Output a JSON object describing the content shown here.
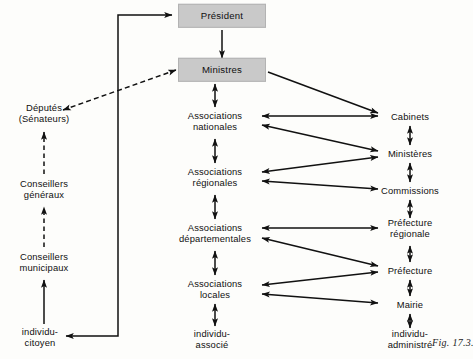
{
  "figure": {
    "caption": "Fig. 17.3.",
    "width": 473,
    "height": 359,
    "background_color": "#fdfdfb",
    "ink_color": "#111111",
    "box_fill_color": "#c9c9c9"
  },
  "nodes": {
    "president": {
      "line1": "Président",
      "line2": "",
      "x": 222,
      "y": 16,
      "boxed": true
    },
    "ministres": {
      "line1": "Ministres",
      "line2": "",
      "x": 222,
      "y": 70,
      "boxed": true
    },
    "deputes": {
      "line1": "Députés",
      "line2": "(Sénateurs)",
      "x": 44,
      "y": 113,
      "boxed": false
    },
    "conseillers_generaux": {
      "line1": "Conseillers",
      "line2": "généraux",
      "x": 44,
      "y": 189,
      "boxed": false
    },
    "conseillers_municipaux": {
      "line1": "Conseillers",
      "line2": "municipaux",
      "x": 44,
      "y": 262,
      "boxed": false
    },
    "individu_citoyen": {
      "line1": "individu-",
      "line2": "citoyen",
      "x": 40,
      "y": 337,
      "boxed": false
    },
    "assoc_nationales": {
      "line1": "Associations",
      "line2": "nationales",
      "x": 215,
      "y": 121,
      "boxed": false
    },
    "assoc_regionales": {
      "line1": "Associations",
      "line2": "régionales",
      "x": 215,
      "y": 177,
      "boxed": false
    },
    "assoc_departementales": {
      "line1": "Associations",
      "line2": "départementales",
      "x": 215,
      "y": 233,
      "boxed": false
    },
    "assoc_locales": {
      "line1": "Associations",
      "line2": "locales",
      "x": 215,
      "y": 289,
      "boxed": false
    },
    "individu_associe": {
      "line1": "individu-",
      "line2": "associé",
      "x": 212,
      "y": 339,
      "boxed": false
    },
    "cabinets": {
      "line1": "Cabinets",
      "line2": "",
      "x": 410,
      "y": 117,
      "boxed": false
    },
    "ministeres": {
      "line1": "Ministères",
      "line2": "",
      "x": 410,
      "y": 154,
      "boxed": false
    },
    "commissions": {
      "line1": "Commissions",
      "line2": "",
      "x": 410,
      "y": 191,
      "boxed": false
    },
    "prefecture_regionale": {
      "line1": "Préfecture",
      "line2": "régionale",
      "x": 410,
      "y": 228,
      "boxed": false
    },
    "prefecture": {
      "line1": "Préfecture",
      "line2": "",
      "x": 410,
      "y": 271,
      "boxed": false
    },
    "mairie": {
      "line1": "Mairie",
      "line2": "",
      "x": 410,
      "y": 305,
      "boxed": false
    },
    "individu_administre": {
      "line1": "individu-",
      "line2": "administré",
      "x": 410,
      "y": 339,
      "boxed": false
    }
  },
  "edges": [
    {
      "name": "president-to-ministres",
      "style": "solid",
      "heads": "end"
    },
    {
      "name": "ministres-to-deputes",
      "style": "dashed",
      "heads": "both"
    },
    {
      "name": "deputes-to-conseillers-generaux",
      "style": "dashed",
      "heads": "end"
    },
    {
      "name": "conseillers-generaux-to-municipaux",
      "style": "dashed",
      "heads": "end"
    },
    {
      "name": "individu-citoyen-to-municipaux",
      "style": "solid",
      "heads": "end"
    },
    {
      "name": "individu-citoyen-to-president",
      "style": "solid",
      "heads": "both"
    },
    {
      "name": "ministres-to-assoc-nationales",
      "style": "solid",
      "heads": "both"
    },
    {
      "name": "assoc-nationales-to-regionales",
      "style": "solid",
      "heads": "both"
    },
    {
      "name": "assoc-regionales-to-departementales",
      "style": "solid",
      "heads": "both"
    },
    {
      "name": "assoc-departementales-to-locales",
      "style": "solid",
      "heads": "both"
    },
    {
      "name": "assoc-locales-to-individu-associe",
      "style": "solid",
      "heads": "both"
    },
    {
      "name": "ministres-to-cabinets",
      "style": "solid",
      "heads": "end"
    },
    {
      "name": "cabinets-to-ministeres",
      "style": "solid",
      "heads": "both"
    },
    {
      "name": "ministeres-to-commissions",
      "style": "solid",
      "heads": "both"
    },
    {
      "name": "commissions-to-prefecture-regionale",
      "style": "solid",
      "heads": "both"
    },
    {
      "name": "prefecture-regionale-to-prefecture",
      "style": "solid",
      "heads": "both"
    },
    {
      "name": "prefecture-to-mairie",
      "style": "solid",
      "heads": "both"
    },
    {
      "name": "mairie-to-individu-administre",
      "style": "solid",
      "heads": "both"
    },
    {
      "name": "assoc-nationales-to-cabinets",
      "style": "solid",
      "heads": "both"
    },
    {
      "name": "assoc-nationales-to-ministeres",
      "style": "solid",
      "heads": "both"
    },
    {
      "name": "assoc-regionales-to-ministeres",
      "style": "solid",
      "heads": "both"
    },
    {
      "name": "assoc-regionales-to-commissions",
      "style": "solid",
      "heads": "both"
    },
    {
      "name": "assoc-departementales-to-prefecture-regionale",
      "style": "solid",
      "heads": "both"
    },
    {
      "name": "assoc-departementales-to-prefecture",
      "style": "solid",
      "heads": "both"
    },
    {
      "name": "assoc-locales-to-prefecture",
      "style": "solid",
      "heads": "both"
    },
    {
      "name": "assoc-locales-to-mairie",
      "style": "solid",
      "heads": "both"
    }
  ]
}
